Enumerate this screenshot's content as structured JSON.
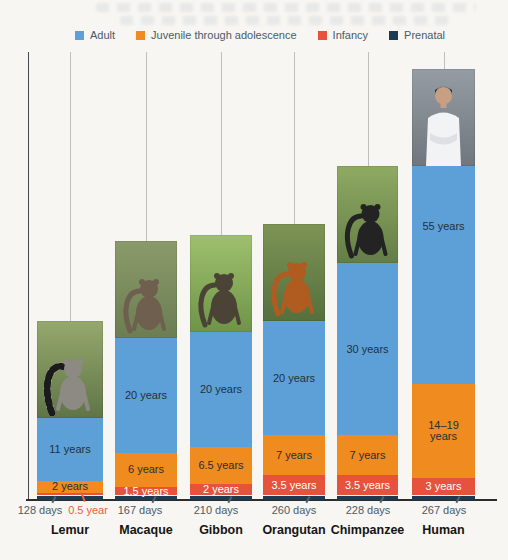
{
  "legend": {
    "items": [
      {
        "key": "adult",
        "label": "Adult",
        "color": "#5da0d8"
      },
      {
        "key": "juvenile",
        "label": "Juvenile through adolescence",
        "color": "#f08b1f"
      },
      {
        "key": "infancy",
        "label": "Infancy",
        "color": "#e6523c"
      },
      {
        "key": "prenatal",
        "label": "Prenatal",
        "color": "#1c3a52"
      }
    ]
  },
  "chart_data": {
    "type": "bar",
    "stacked": true,
    "unit": "years",
    "grid": false,
    "legend_position": "top",
    "px_per_year": 5.73,
    "baseline_y": 500,
    "top_tick_y": 52,
    "prenatal_min_px": 4.5,
    "photo_height_px": 97,
    "colors": {
      "adult": "#5da0d8",
      "juvenile": "#f08b1f",
      "infancy": "#e6523c",
      "prenatal": "#1c3a52",
      "dark_text": "#243039",
      "light_text": "#ffffff",
      "slate_text": "#4b5a66",
      "red_text": "#e8613f"
    },
    "categories": [
      "Lemur",
      "Macaque",
      "Gibbon",
      "Orangutan",
      "Chimpanzee",
      "Human"
    ],
    "series": [
      {
        "key": "prenatal",
        "name": "Prenatal",
        "values_days": [
          128,
          167,
          210,
          260,
          228,
          267
        ],
        "values_years": [
          0.35,
          0.46,
          0.58,
          0.71,
          0.62,
          0.73
        ],
        "labels": [
          "128 days",
          "167 days",
          "210 days",
          "260 days",
          "228 days",
          "267 days"
        ]
      },
      {
        "key": "infancy",
        "name": "Infancy",
        "values_years": [
          0.5,
          1.5,
          2,
          3.5,
          3.5,
          3
        ],
        "labels": [
          "0.5 year",
          "1.5 years",
          "2 years",
          "3.5 years",
          "3.5 years",
          "3 years"
        ]
      },
      {
        "key": "juvenile",
        "name": "Juvenile through adolescence",
        "values_years": [
          2,
          6,
          6.5,
          7,
          7,
          16.5
        ],
        "labels": [
          "2 years",
          "6 years",
          "6.5 years",
          "7 years",
          "7 years",
          "14–19 years"
        ]
      },
      {
        "key": "adult",
        "name": "Adult",
        "values_years": [
          11,
          20,
          20,
          20,
          30,
          55
        ],
        "labels": [
          "11 years",
          "20 years",
          "20 years",
          "20 years",
          "30 years",
          "55 years"
        ]
      }
    ],
    "columns": [
      {
        "name": "Lemur",
        "x": 37,
        "width": 66,
        "days_center_x": 40,
        "infancy_label_outside": true,
        "infancy_outside_x": 88,
        "photo": {
          "alt": "ring-tailed lemur in foliage",
          "shape": "primate",
          "bg_top": "#96a86d",
          "bg_bottom": "#5f7547",
          "subject": "#8d8a84",
          "ringed_tail": true
        }
      },
      {
        "name": "Macaque",
        "x": 115,
        "width": 62,
        "days_center_x": 140,
        "infancy_label_outside": false,
        "photo": {
          "alt": "macaque monkey",
          "shape": "primate",
          "bg_top": "#8a9a6a",
          "bg_bottom": "#6b7d52",
          "subject": "#6f5f4e",
          "ringed_tail": false
        }
      },
      {
        "name": "Gibbon",
        "x": 190,
        "width": 62,
        "days_center_x": 216,
        "infancy_label_outside": false,
        "photo": {
          "alt": "gibbon hanging from branch",
          "shape": "primate",
          "bg_top": "#9ec06e",
          "bg_bottom": "#6f9448",
          "subject": "#4a4336",
          "ringed_tail": false
        }
      },
      {
        "name": "Orangutan",
        "x": 263,
        "width": 62,
        "days_center_x": 294,
        "infancy_label_outside": false,
        "photo": {
          "alt": "orangutan",
          "shape": "primate",
          "bg_top": "#7e9455",
          "bg_bottom": "#55703e",
          "subject": "#b05c20",
          "ringed_tail": false
        }
      },
      {
        "name": "Chimpanzee",
        "x": 337,
        "width": 61,
        "days_center_x": 368,
        "infancy_label_outside": false,
        "photo": {
          "alt": "chimpanzee in grass",
          "shape": "primate",
          "bg_top": "#8faa62",
          "bg_bottom": "#637e45",
          "subject": "#232323",
          "ringed_tail": false
        }
      },
      {
        "name": "Human",
        "x": 412,
        "width": 63,
        "days_center_x": 444,
        "infancy_label_outside": false,
        "photo_overlaps_bar": true,
        "photo": {
          "alt": "man with arms crossed, white shirt",
          "shape": "human",
          "bg_top": "#969ca3",
          "bg_bottom": "#70767d",
          "subject": "#f2f3f5",
          "skin": "#c99f82",
          "hair": "#2e2620"
        }
      }
    ]
  }
}
